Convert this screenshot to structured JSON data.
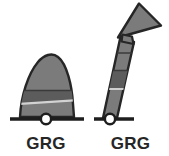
{
  "canvas": {
    "width": 169,
    "height": 156,
    "background": "#ffffff"
  },
  "palette": {
    "body_fill": "#7b7b7b",
    "body_fill_dark": "#5c5c5c",
    "body_fill_darker": "#4f4f4f",
    "outline": "#262626",
    "baseline": "#1e1e1e",
    "pivot_fill": "#ffffff",
    "pivot_outline": "#1e1e1e",
    "divider_light": "#cfcfcf",
    "label_color": "#262626"
  },
  "figures": [
    {
      "id": "dome",
      "name": "dome-shape",
      "shape": "rounded-dome",
      "label": "GRG",
      "segments": 3,
      "has_baseline": true,
      "has_pivot": true,
      "pivot_cx": 46,
      "pivot_cy": 119,
      "pivot_r": 5,
      "baseline_x1": 10,
      "baseline_x2": 84,
      "baseline_y": 119,
      "outline_path": "M 20 117 C 21 96 28 74 38 62 C 44 55 52 52 58 57 C 67 64 72 86 73 104 C 73.5 110 73.8 114 74 117 Z",
      "divider_upper_path": "M 24.2 92 L 71.2 92",
      "divider_lower_path": "M 21.3 104 L 73.4 100",
      "band_path": "M 24.2 92 L 71.2 92 L 73.4 100 L 21.3 104 Z"
    },
    {
      "id": "arrow",
      "name": "up-arrow-shape",
      "shape": "upward-arrow",
      "label": "GRG",
      "segments": 4,
      "has_baseline": true,
      "has_pivot": true,
      "pivot_cx": 18,
      "pivot_cy": 119,
      "pivot_r": 5,
      "baseline_x1": 2,
      "baseline_x2": 42,
      "baseline_y": 119,
      "shaft_path": "M 11 118 L 25 118 L 42 42 L 28 39 Z",
      "head_path": "M 27 37 L 68 26 L 47 5 Z",
      "notch_path": "M 30 41 L 41 43 L 40 38 L 31 36 Z",
      "divider_1_path": "M 18.5 90 L 32.6 90",
      "divider_2_path": "M 22.2 71 L 36.2 71",
      "divider_3_path": "M 25.4 54 L 39.4 54"
    }
  ],
  "labels": {
    "dome": "GRG",
    "arrow": "GRG"
  }
}
